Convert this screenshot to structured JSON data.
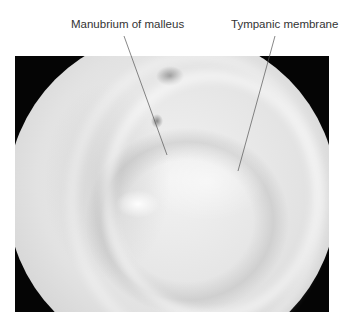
{
  "figure": {
    "type": "otoscopic photograph",
    "labels": [
      {
        "id": "manubrium",
        "text": "Manubrium of malleus"
      },
      {
        "id": "tympanic",
        "text": "Tympanic membrane"
      }
    ],
    "colors": {
      "frame": "#050505",
      "label_text": "#333333",
      "leader_line": "#555555",
      "membrane": "#e2e2e2"
    }
  }
}
